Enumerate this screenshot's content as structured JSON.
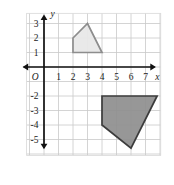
{
  "figure": {
    "origin_label": "O",
    "x_axis_name": "x",
    "y_axis_name": "y"
  },
  "chart_data": {
    "type": "scatter",
    "title": "",
    "xlabel": "x",
    "ylabel": "y",
    "grid": true,
    "legend": "none",
    "xlim": [
      -1,
      8
    ],
    "ylim": [
      -6,
      4
    ],
    "x_tick_labels": [
      "1",
      "2",
      "3",
      "4",
      "5",
      "6",
      "7"
    ],
    "x_tick_values": [
      1,
      2,
      3,
      4,
      5,
      6,
      7
    ],
    "y_tick_labels": [
      "3",
      "2",
      "1",
      "-2",
      "-3",
      "-4",
      "-5"
    ],
    "y_tick_values": [
      3,
      2,
      1,
      -2,
      -3,
      -4,
      -5
    ],
    "origin_label": "O",
    "series": [
      {
        "name": "light-quadrilateral",
        "type": "polygon",
        "fill_color": "#e8e8e8",
        "stroke_color": "#8d8d8d",
        "points": [
          [
            2,
            1
          ],
          [
            2,
            2
          ],
          [
            3,
            3
          ],
          [
            4,
            1
          ]
        ]
      },
      {
        "name": "dark-quadrilateral",
        "type": "polygon",
        "fill_color": "#8e8e8e",
        "stroke_color": "#3c3c3c",
        "points": [
          [
            4,
            -2
          ],
          [
            7.8,
            -2
          ],
          [
            6,
            -5.6
          ],
          [
            4,
            -4
          ]
        ]
      }
    ]
  },
  "ticks": {
    "x": [
      {
        "label": "1",
        "value": 1
      },
      {
        "label": "2",
        "value": 2
      },
      {
        "label": "3",
        "value": 3
      },
      {
        "label": "4",
        "value": 4
      },
      {
        "label": "5",
        "value": 5
      },
      {
        "label": "6",
        "value": 6
      },
      {
        "label": "7",
        "value": 7
      }
    ],
    "y": [
      {
        "label": "3",
        "value": 3
      },
      {
        "label": "2",
        "value": 2
      },
      {
        "label": "1",
        "value": 1
      },
      {
        "label": "-2",
        "value": -2
      },
      {
        "label": "-3",
        "value": -3
      },
      {
        "label": "-4",
        "value": -4
      },
      {
        "label": "-5",
        "value": -5
      }
    ]
  },
  "colors": {
    "grid": "#c9c9c9",
    "axis": "#111111",
    "light_fill": "#e8e8e8",
    "light_stroke": "#8d8d8d",
    "dark_fill": "#8e8e8e",
    "dark_stroke": "#3c3c3c",
    "background": "#ffffff"
  }
}
